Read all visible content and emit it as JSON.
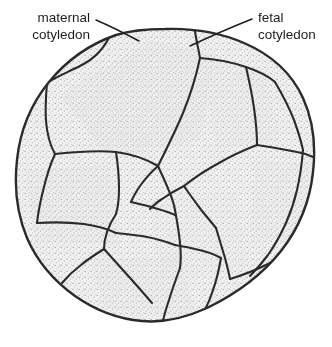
{
  "figure": {
    "background_color": "#ffffff",
    "outline_color": "#2b2b2b",
    "fill_color": "#efefef",
    "stipple_color": "#8d8d8d",
    "text_color": "#1d1d1d"
  },
  "labels": {
    "maternal": {
      "line1": "maternal",
      "line2": "cotyledon"
    },
    "fetal": {
      "line1": "fetal",
      "line2": "cotyledon"
    }
  },
  "leader_lines": {
    "maternal_leader": "from maternal cotyledon label to upper-left lobe",
    "fetal_leader": "from fetal cotyledon label to upper-central lobe"
  }
}
